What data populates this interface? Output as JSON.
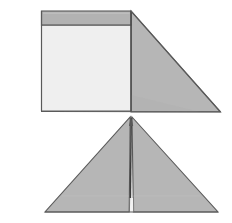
{
  "figure": {
    "background_color": "#ffffff",
    "canvas": {
      "width": 232,
      "height": 223
    },
    "palette": {
      "face_light": "#efefef",
      "face_gray": "#b6b6b6",
      "face_gray_band": "#b2b2b2",
      "face_gray_dark": "#ababab",
      "outline": "#4a4a4a",
      "outline_soft": "#6e6e6e",
      "seam": "#3c3c3c",
      "background": "#ffffff"
    },
    "views": [
      {
        "name": "upper-view",
        "label": "Upper view — wedge with front panel",
        "parts": [
          {
            "name": "front-panel-face",
            "label": "Front panel light face",
            "shape": "quad",
            "fill": "#efefef",
            "points": "41,25 131,25 131,111 41,111"
          },
          {
            "name": "top-band-face",
            "label": "Top band gray face",
            "shape": "quad",
            "fill": "#b2b2b2",
            "points": "41,11 131,11 131,25 41,25"
          },
          {
            "name": "side-wedge-face",
            "label": "Right sloping wedge face",
            "shape": "triangle",
            "fill": "#b6b6b6",
            "points": "131,11 220,112 131,112"
          }
        ]
      },
      {
        "name": "lower-view",
        "label": "Lower view — symmetric double wedge",
        "parts": [
          {
            "name": "left-wedge-face",
            "label": "Left wedge face",
            "shape": "triangle",
            "fill": "#b6b6b6",
            "points": "130,117 128,212 45,212"
          },
          {
            "name": "right-wedge-face",
            "label": "Right wedge face",
            "shape": "triangle",
            "fill": "#b6b6b6",
            "points": "132,117 218,212 134,212"
          },
          {
            "name": "center-seam",
            "label": "Central vertical seam",
            "shape": "line",
            "stroke": "#3c3c3c",
            "points": "131,117 130,205"
          }
        ]
      }
    ]
  }
}
